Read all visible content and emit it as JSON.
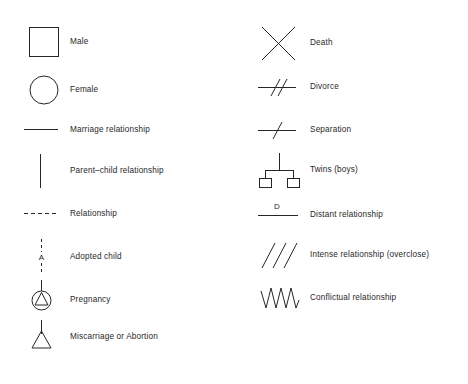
{
  "page": {
    "background_color": "#ffffff",
    "line_color": "#262626",
    "text_color": "#1f1f1f"
  },
  "columns": [
    {
      "name": "left",
      "items": [
        {
          "icon": "square-symbol",
          "label": "Male"
        },
        {
          "icon": "circle-symbol",
          "label": "Female"
        },
        {
          "icon": "horizontal-line-symbol",
          "label": "Marriage relationship"
        },
        {
          "icon": "vertical-line-symbol",
          "label": "Parent–child relationship"
        },
        {
          "icon": "dashed-line-symbol",
          "label": "Relationship"
        },
        {
          "icon": "adopted-child-symbol",
          "label": "Adopted child",
          "annotation": "A"
        },
        {
          "icon": "pregnancy-symbol",
          "label": "Pregnancy"
        },
        {
          "icon": "miscarriage-symbol",
          "label": "Miscarriage or Abortion"
        }
      ]
    },
    {
      "name": "right",
      "items": [
        {
          "icon": "cross-x-symbol",
          "label": "Death"
        },
        {
          "icon": "double-slash-line-symbol",
          "label": "Divorce"
        },
        {
          "icon": "single-slash-line-symbol",
          "label": "Separation"
        },
        {
          "icon": "twins-symbol",
          "label": "Twins (boys)"
        },
        {
          "icon": "labeled-line-symbol",
          "label": "Distant relationship",
          "annotation": "D"
        },
        {
          "icon": "triple-slash-symbol",
          "label": "Intense relationship (overclose)"
        },
        {
          "icon": "zigzag-symbol",
          "label": "Conflictual relationship"
        }
      ]
    }
  ]
}
